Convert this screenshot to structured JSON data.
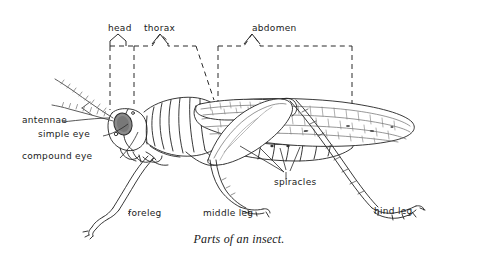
{
  "figure": {
    "title": "Parts of an insect.",
    "caption": "Parts of an insect.",
    "background_color": "#ffffff",
    "ink_color": "#1a1a1a",
    "shading_color": "#8d8d8d"
  },
  "bracket_labels": [
    {
      "id": "head",
      "label": "head"
    },
    {
      "id": "thorax",
      "label": "thorax"
    },
    {
      "id": "abdomen",
      "label": "abdomen"
    }
  ],
  "part_labels": [
    {
      "id": "antennae",
      "label": "antennae"
    },
    {
      "id": "simple-eye",
      "label": "simple eye"
    },
    {
      "id": "compound-eye",
      "label": "compound eye"
    },
    {
      "id": "spiracles",
      "label": "spiracles"
    },
    {
      "id": "foreleg",
      "label": "foreleg"
    },
    {
      "id": "middle-leg",
      "label": "middle leg"
    },
    {
      "id": "hind-leg",
      "label": "hind leg"
    }
  ]
}
